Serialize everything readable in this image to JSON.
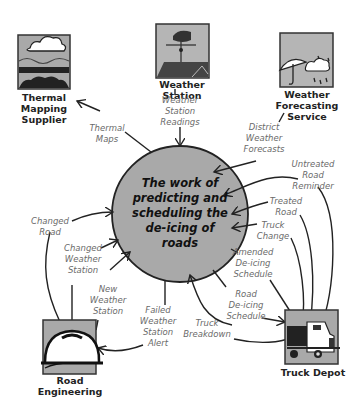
{
  "diagram": {
    "type": "context-diagram",
    "process": {
      "label": "The work of\npredicting  and\nscheduling the\nde-icing of\nroads"
    },
    "entities": [
      {
        "id": "thermal",
        "label": "Thermal\nMapping\nSupplier",
        "icon": "landscape-clouds-icon"
      },
      {
        "id": "station",
        "label": "Weather\nStation",
        "icon": "weathervane-icon"
      },
      {
        "id": "forecast",
        "label": "Weather\nForecasting\nService",
        "icon": "umbrella-rain-icon"
      },
      {
        "id": "road",
        "label": "Road\nEngineering",
        "icon": "hard-hat-icon"
      },
      {
        "id": "depot",
        "label": "Truck Depot",
        "icon": "truck-icon"
      }
    ],
    "flows": [
      {
        "label": "Thermal\nMaps",
        "from": "process",
        "to": "thermal"
      },
      {
        "label": "Weather\nStation\nReadings",
        "from": "station",
        "to": "process"
      },
      {
        "label": "District\nWeather\nForecasts",
        "from": "forecast",
        "to": "process"
      },
      {
        "label": "Untreated\nRoad\nReminder",
        "from": "depot",
        "to": "process"
      },
      {
        "label": "Treated\nRoad",
        "from": "depot",
        "to": "process"
      },
      {
        "label": "Truck\nChange",
        "from": "depot",
        "to": "process"
      },
      {
        "label": "Amended\nDe-icing\nSchedule",
        "from": "process",
        "to": "depot"
      },
      {
        "label": "Road\nDe-icing\nSchedule",
        "from": "process",
        "to": "depot"
      },
      {
        "label": "Truck\nBreakdown",
        "from": "depot",
        "to": "process"
      },
      {
        "label": "Failed\nWeather\nStation\nAlert",
        "from": "process",
        "to": "road"
      },
      {
        "label": "New\nWeather\nStation",
        "from": "road",
        "to": "process"
      },
      {
        "label": "Changed\nWeather\nStation",
        "from": "road",
        "to": "process"
      },
      {
        "label": "Changed\nRoad",
        "from": "road",
        "to": "process"
      }
    ]
  }
}
